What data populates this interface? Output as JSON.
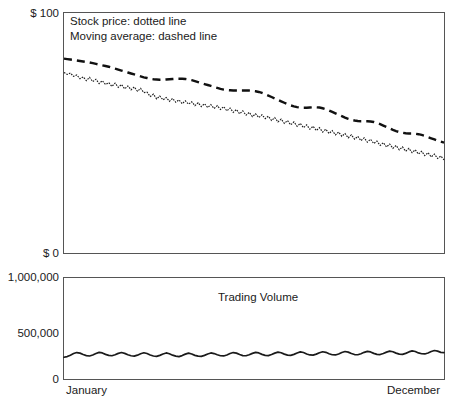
{
  "chart_data": {
    "type": "line",
    "title": "",
    "subtitle": "",
    "panels": [
      {
        "name": "price-panel",
        "ylabel": "",
        "ylim": [
          0,
          100
        ],
        "y_ticks": [
          {
            "value": 100,
            "label": "$ 100"
          },
          {
            "value": 0,
            "label": "$ 0"
          }
        ],
        "grid": false,
        "legend_position": "top-left",
        "annotations": [
          "Stock price: dotted line",
          "Moving average: dashed line"
        ],
        "series": [
          {
            "name": "Stock price",
            "style": "dotted",
            "color": "#1a1a1a",
            "values": [
              75.2,
              74.4,
              75.0,
              73.6,
              74.2,
              72.6,
              73.4,
              71.8,
              73.2,
              71.4,
              72.4,
              70.6,
              71.8,
              70.2,
              71.0,
              69.4,
              70.8,
              69.0,
              70.2,
              68.4,
              69.6,
              68.0,
              69.2,
              67.4,
              68.6,
              66.8,
              67.0,
              65.2,
              66.2,
              64.2,
              65.4,
              63.8,
              64.8,
              63.2,
              64.4,
              62.8,
              63.8,
              62.2,
              63.4,
              62.0,
              63.0,
              61.4,
              62.6,
              61.0,
              62.2,
              60.6,
              61.8,
              60.2,
              61.4,
              59.8,
              61.0,
              59.2,
              60.4,
              58.6,
              59.8,
              58.0,
              59.2,
              57.4,
              58.6,
              56.8,
              58.0,
              56.4,
              57.6,
              56.0,
              57.0,
              55.2,
              56.4,
              54.6,
              55.8,
              54.0,
              55.2,
              53.4,
              54.6,
              52.8,
              54.0,
              52.2,
              53.4,
              51.6,
              52.8,
              51.0,
              52.2,
              50.4,
              51.6,
              49.8,
              51.0,
              49.2,
              50.4,
              48.6,
              49.8,
              48.0,
              49.2,
              47.4,
              48.6,
              46.8,
              48.0,
              46.2,
              47.4,
              45.6,
              46.6,
              44.8,
              46.0,
              44.2,
              45.4,
              43.6,
              44.8,
              43.0,
              44.2,
              42.4,
              43.6,
              41.8,
              43.0,
              41.2,
              42.4,
              40.6,
              41.8,
              40.0,
              41.2,
              39.4,
              40.4,
              38.8
            ]
          },
          {
            "name": "Moving average",
            "style": "dashed",
            "color": "#111111",
            "values": [
              81.0,
              80.8,
              80.6,
              80.4,
              80.2,
              80.0,
              79.8,
              79.6,
              79.4,
              79.1,
              78.8,
              78.5,
              78.2,
              77.9,
              77.6,
              77.2,
              76.8,
              76.4,
              76.0,
              75.6,
              75.2,
              74.8,
              74.4,
              74.0,
              73.6,
              73.2,
              72.9,
              72.6,
              72.4,
              72.3,
              72.2,
              72.2,
              72.3,
              72.4,
              72.5,
              72.6,
              72.6,
              72.6,
              72.5,
              72.3,
              72.0,
              71.6,
              71.2,
              70.8,
              70.4,
              70.0,
              69.6,
              69.2,
              68.8,
              68.4,
              68.1,
              67.9,
              67.8,
              67.7,
              67.7,
              67.7,
              67.7,
              67.7,
              67.7,
              67.6,
              67.4,
              67.1,
              66.7,
              66.2,
              65.6,
              65.0,
              64.4,
              63.8,
              63.2,
              62.6,
              62.0,
              61.5,
              61.1,
              60.8,
              60.6,
              60.5,
              60.5,
              60.6,
              60.7,
              60.7,
              60.6,
              60.3,
              59.9,
              59.4,
              58.8,
              58.2,
              57.6,
              57.0,
              56.4,
              55.9,
              55.5,
              55.2,
              55.0,
              54.9,
              54.9,
              54.9,
              54.8,
              54.6,
              54.2,
              53.7,
              53.1,
              52.5,
              51.9,
              51.3,
              50.8,
              50.4,
              50.1,
              49.9,
              49.8,
              49.8,
              49.7,
              49.5,
              49.2,
              48.8,
              48.3,
              47.8,
              47.3,
              46.8,
              46.4,
              46.0
            ]
          }
        ]
      },
      {
        "name": "volume-panel",
        "ylabel": "",
        "ylim": [
          0,
          1000000
        ],
        "y_ticks": [
          {
            "value": 1000000,
            "label": "1,000,000"
          },
          {
            "value": 500000,
            "label": "500,000"
          },
          {
            "value": 0,
            "label": "0"
          }
        ],
        "grid": false,
        "annotations": [
          "Trading Volume"
        ],
        "series": [
          {
            "name": "Trading Volume",
            "style": "solid",
            "color": "#1a1a1a",
            "values": [
              215000,
              222000,
              236000,
              252000,
              262000,
              256000,
              242000,
              232000,
              228000,
              238000,
              252000,
              264000,
              258000,
              244000,
              234000,
              230000,
              240000,
              254000,
              262000,
              254000,
              240000,
              230000,
              226000,
              236000,
              250000,
              260000,
              252000,
              238000,
              228000,
              224000,
              234000,
              248000,
              258000,
              250000,
              236000,
              226000,
              222000,
              232000,
              246000,
              256000,
              248000,
              234000,
              226000,
              224000,
              234000,
              248000,
              258000,
              252000,
              240000,
              230000,
              228000,
              238000,
              252000,
              262000,
              256000,
              242000,
              232000,
              230000,
              240000,
              254000,
              264000,
              258000,
              244000,
              234000,
              232000,
              242000,
              256000,
              266000,
              260000,
              246000,
              236000,
              234000,
              244000,
              258000,
              268000,
              262000,
              248000,
              238000,
              236000,
              246000,
              260000,
              270000,
              264000,
              250000,
              240000,
              238000,
              248000,
              262000,
              272000,
              266000,
              252000,
              242000,
              240000,
              250000,
              264000,
              274000,
              268000,
              254000,
              244000,
              242000,
              252000,
              266000,
              276000,
              270000,
              256000,
              246000,
              244000,
              254000,
              268000,
              278000,
              272000,
              258000,
              250000,
              248000,
              258000,
              272000,
              282000,
              276000,
              264000,
              262000
            ]
          }
        ]
      }
    ],
    "x_ticks": [
      {
        "position": "start",
        "label": "January"
      },
      {
        "position": "end",
        "label": "December"
      }
    ],
    "x_axis_label": ""
  },
  "price_axis": {
    "top_label": "$ 100",
    "bottom_label": "$ 0"
  },
  "volume_axis": {
    "top_label": "1,000,000",
    "mid_label": "500,000",
    "bottom_label": "0"
  },
  "legend": {
    "line1": "Stock price: dotted line",
    "line2": "Moving average: dashed line"
  },
  "volume_panel": {
    "title": "Trading Volume"
  },
  "x_axis": {
    "start_label": "January",
    "end_label": "December"
  },
  "colors": {
    "frame": "#555555",
    "stroke": "#1a1a1a",
    "background": "#ffffff"
  }
}
